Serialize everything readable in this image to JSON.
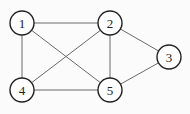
{
  "graph": {
    "nodes": [
      {
        "id": "1",
        "label": "1",
        "x": 22,
        "y": 23
      },
      {
        "id": "2",
        "label": "2",
        "x": 110,
        "y": 23
      },
      {
        "id": "3",
        "label": "3",
        "x": 169,
        "y": 57
      },
      {
        "id": "4",
        "label": "4",
        "x": 22,
        "y": 90
      },
      {
        "id": "5",
        "label": "5",
        "x": 110,
        "y": 90
      }
    ],
    "edges": [
      [
        "1",
        "2"
      ],
      [
        "1",
        "4"
      ],
      [
        "1",
        "5"
      ],
      [
        "2",
        "4"
      ],
      [
        "2",
        "5"
      ],
      [
        "2",
        "3"
      ],
      [
        "3",
        "5"
      ],
      [
        "4",
        "5"
      ]
    ],
    "node_radius": 12
  }
}
